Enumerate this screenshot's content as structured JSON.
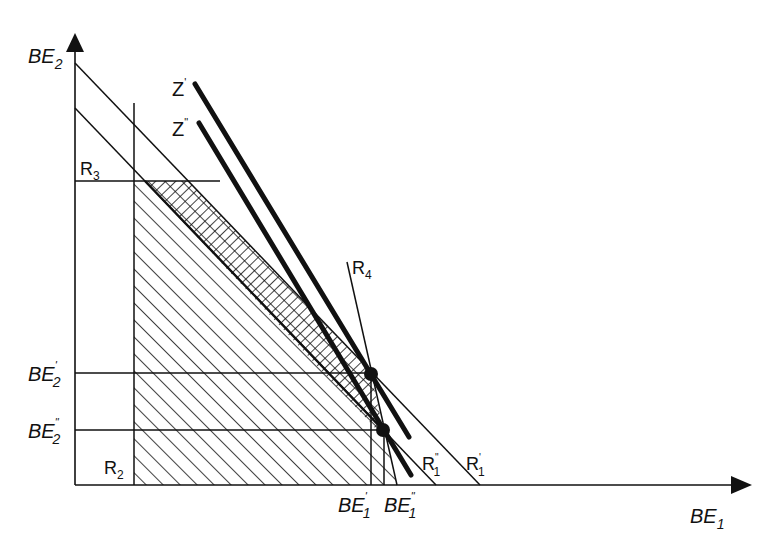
{
  "diagram": {
    "colors": {
      "ink": "#111111",
      "background": "#ffffff"
    },
    "axes": {
      "y_label": {
        "main": "BE",
        "sub": "2"
      },
      "x_label": {
        "main": "BE",
        "sub": "1"
      }
    },
    "y_ticks": [
      {
        "main": "BE",
        "sup": "'",
        "sub": "2"
      },
      {
        "main": "BE",
        "sup": "\"",
        "sub": "2"
      }
    ],
    "x_ticks": [
      {
        "main": "BE",
        "sup": "'",
        "sub": "1"
      },
      {
        "main": "BE",
        "sup": "\"",
        "sub": "1"
      }
    ],
    "line_labels": {
      "z_prime": {
        "main": "Z",
        "sup": "'"
      },
      "z_double": {
        "main": "Z",
        "sup": "\""
      },
      "r1_prime": {
        "main": "R",
        "sup": "'",
        "sub": "1"
      },
      "r1_double": {
        "main": "R",
        "sup": "\"",
        "sub": "1"
      },
      "r2": {
        "main": "R",
        "sub": "2"
      },
      "r3": {
        "main": "R",
        "sub": "3"
      },
      "r4": {
        "main": "R",
        "sub": "4"
      }
    }
  }
}
